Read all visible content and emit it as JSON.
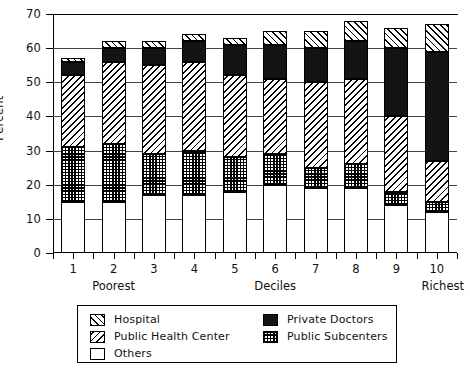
{
  "chart_data": {
    "type": "bar",
    "subtype": "stacked-bar",
    "title": "",
    "xlabel": "Deciles",
    "ylabel": "Percent",
    "ylim": [
      0,
      70
    ],
    "ytick_step": 10,
    "yticks": [
      0,
      10,
      20,
      30,
      40,
      50,
      60,
      70
    ],
    "grid": true,
    "grid_axis": "y",
    "legend_position": "below-axes",
    "categories": [
      "1",
      "2",
      "3",
      "4",
      "5",
      "6",
      "7",
      "8",
      "9",
      "10"
    ],
    "category_notes": {
      "left": "Poorest",
      "center": "Deciles",
      "right": "Richest"
    },
    "stack_order_bottom_to_top": [
      "Others",
      "Public Subcenters",
      "Public Health Center",
      "Private Doctors",
      "Hospital"
    ],
    "series": [
      {
        "name": "Others",
        "pattern": "white",
        "color": "#ffffff",
        "values": [
          15,
          15,
          17,
          17,
          18,
          20,
          19,
          19,
          14,
          12
        ]
      },
      {
        "name": "Public Subcenters",
        "pattern": "checkered",
        "color": "#000000",
        "values": [
          16,
          17,
          12,
          13,
          10,
          9,
          6,
          7,
          4,
          3
        ]
      },
      {
        "name": "Public Health Center",
        "pattern": "backslash-hatch",
        "color": "#000000",
        "values": [
          21,
          24,
          26,
          26,
          24,
          22,
          25,
          25,
          22,
          12
        ]
      },
      {
        "name": "Private Doctors",
        "pattern": "solid-black",
        "color": "#141414",
        "values": [
          4,
          4,
          5,
          6,
          9,
          10,
          10,
          11,
          20,
          32
        ]
      },
      {
        "name": "Hospital",
        "pattern": "slash-hatch",
        "color": "#000000",
        "values": [
          1,
          2,
          2,
          2,
          2,
          4,
          5,
          6,
          6,
          8
        ]
      }
    ],
    "cumulative_tops": [
      [
        15,
        31,
        52,
        56,
        57
      ],
      [
        15,
        32,
        56,
        60,
        62
      ],
      [
        17,
        29,
        55,
        60,
        62
      ],
      [
        17,
        30,
        56,
        62,
        64
      ],
      [
        18,
        28,
        52,
        61,
        63
      ],
      [
        20,
        29,
        51,
        61,
        65
      ],
      [
        19,
        25,
        50,
        60,
        65
      ],
      [
        19,
        26,
        51,
        62,
        68
      ],
      [
        14,
        18,
        40,
        60,
        66
      ],
      [
        12,
        15,
        27,
        59,
        67
      ]
    ],
    "totals": [
      57,
      62,
      62,
      64,
      63,
      65,
      65,
      68,
      66,
      67
    ],
    "legend": [
      {
        "label": "Hospital",
        "pattern": "slash-hatch",
        "col": 0,
        "row": 0
      },
      {
        "label": "Public Health Center",
        "pattern": "backslash-hatch",
        "col": 0,
        "row": 1
      },
      {
        "label": "Others",
        "pattern": "white",
        "col": 0,
        "row": 2
      },
      {
        "label": "Private Doctors",
        "pattern": "solid-black",
        "col": 1,
        "row": 0
      },
      {
        "label": "Public Subcenters",
        "pattern": "checkered",
        "col": 1,
        "row": 1
      }
    ]
  }
}
